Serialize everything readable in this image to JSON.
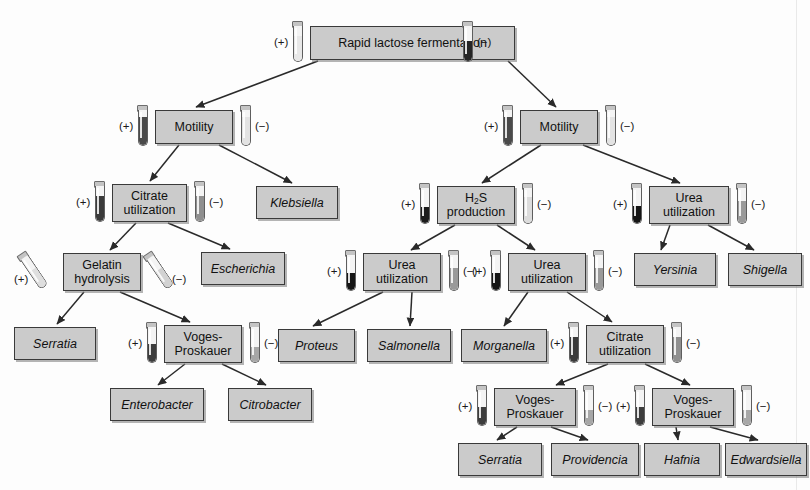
{
  "diagram": {
    "type": "decision-tree",
    "colors": {
      "box_fill": "#cbcbcb",
      "box_border": "#3a3a3a",
      "page_background": "#fdfdfd",
      "arrow": "#2a2a2a",
      "tube_positive_fill": "#2d2d2d",
      "tube_negative_fill": "#b4b4b4"
    },
    "sign_positive": "(+)",
    "sign_negative": "(−)",
    "nodes": [
      {
        "id": "n1",
        "kind": "test",
        "label": "Rapid lactose fermentation",
        "x": 310,
        "y": 26,
        "w": 205,
        "h": 34
      },
      {
        "id": "n2",
        "kind": "test",
        "label": "Motility",
        "x": 155,
        "y": 110,
        "w": 78,
        "h": 34
      },
      {
        "id": "n3",
        "kind": "test",
        "label": "Motility",
        "x": 520,
        "y": 110,
        "w": 78,
        "h": 34
      },
      {
        "id": "n4",
        "kind": "test",
        "label": "Citrate utilization",
        "x": 112,
        "y": 184,
        "w": 75,
        "h": 38
      },
      {
        "id": "n5",
        "kind": "genus",
        "label": "Klebsiella",
        "x": 256,
        "y": 186,
        "w": 82,
        "h": 33
      },
      {
        "id": "n6",
        "kind": "test",
        "label": "H2S production",
        "x": 437,
        "y": 186,
        "w": 78,
        "h": 38,
        "html": "H<sub>2</sub>S<br>production"
      },
      {
        "id": "n7",
        "kind": "test",
        "label": "Urea utilization",
        "x": 649,
        "y": 186,
        "w": 80,
        "h": 38
      },
      {
        "id": "n8",
        "kind": "test",
        "label": "Gelatin hydrolysis",
        "x": 63,
        "y": 253,
        "w": 78,
        "h": 38
      },
      {
        "id": "n9",
        "kind": "genus",
        "label": "Escherichia",
        "x": 201,
        "y": 252,
        "w": 84,
        "h": 33
      },
      {
        "id": "n10",
        "kind": "test",
        "label": "Urea utilization",
        "x": 363,
        "y": 253,
        "w": 78,
        "h": 38
      },
      {
        "id": "n11",
        "kind": "test",
        "label": "Urea utilization",
        "x": 508,
        "y": 253,
        "w": 78,
        "h": 38
      },
      {
        "id": "n12",
        "kind": "genus",
        "label": "Yersinia",
        "x": 634,
        "y": 253,
        "w": 82,
        "h": 33
      },
      {
        "id": "n13",
        "kind": "genus",
        "label": "Shigella",
        "x": 728,
        "y": 253,
        "w": 74,
        "h": 33
      },
      {
        "id": "n14",
        "kind": "genus",
        "label": "Serratia",
        "x": 14,
        "y": 327,
        "w": 82,
        "h": 33
      },
      {
        "id": "n15",
        "kind": "test",
        "label": "Voges-Proskauer",
        "x": 164,
        "y": 325,
        "w": 78,
        "h": 38,
        "html": "Voges-<br>Proskauer"
      },
      {
        "id": "n16",
        "kind": "genus",
        "label": "Proteus",
        "x": 278,
        "y": 329,
        "w": 77,
        "h": 33
      },
      {
        "id": "n17",
        "kind": "genus",
        "label": "Salmonella",
        "x": 367,
        "y": 329,
        "w": 84,
        "h": 33
      },
      {
        "id": "n18",
        "kind": "genus",
        "label": "Morganella",
        "x": 461,
        "y": 329,
        "w": 86,
        "h": 33
      },
      {
        "id": "n19",
        "kind": "test",
        "label": "Citrate utilization",
        "x": 586,
        "y": 325,
        "w": 78,
        "h": 38
      },
      {
        "id": "n20",
        "kind": "genus",
        "label": "Enterobacter",
        "x": 110,
        "y": 388,
        "w": 94,
        "h": 33
      },
      {
        "id": "n21",
        "kind": "genus",
        "label": "Citrobacter",
        "x": 228,
        "y": 388,
        "w": 84,
        "h": 33
      },
      {
        "id": "n22",
        "kind": "test",
        "label": "Voges-Proskauer",
        "x": 494,
        "y": 388,
        "w": 82,
        "h": 38,
        "html": "Voges-<br>Proskauer"
      },
      {
        "id": "n23",
        "kind": "test",
        "label": "Voges-Proskauer",
        "x": 652,
        "y": 388,
        "w": 82,
        "h": 38,
        "html": "Voges-<br>Proskauer"
      },
      {
        "id": "n24",
        "kind": "genus",
        "label": "Serratia",
        "x": 458,
        "y": 443,
        "w": 84,
        "h": 33
      },
      {
        "id": "n25",
        "kind": "genus",
        "label": "Providencia",
        "x": 551,
        "y": 443,
        "w": 88,
        "h": 33
      },
      {
        "id": "n26",
        "kind": "genus",
        "label": "Hafnia",
        "x": 644,
        "y": 443,
        "w": 76,
        "h": 33
      },
      {
        "id": "n27",
        "kind": "genus",
        "label": "Edwardsiella",
        "x": 725,
        "y": 443,
        "w": 82,
        "h": 33
      }
    ],
    "edges": [
      {
        "from": "n1",
        "to": "n2",
        "x1": 318,
        "y1": 61,
        "x2": 196,
        "y2": 107
      },
      {
        "from": "n1",
        "to": "n3",
        "x1": 508,
        "y1": 61,
        "x2": 556,
        "y2": 107
      },
      {
        "from": "n2",
        "to": "n4",
        "x1": 179,
        "y1": 145,
        "x2": 150,
        "y2": 181
      },
      {
        "from": "n2",
        "to": "n5",
        "x1": 219,
        "y1": 145,
        "x2": 292,
        "y2": 183
      },
      {
        "from": "n3",
        "to": "n6",
        "x1": 541,
        "y1": 145,
        "x2": 482,
        "y2": 183
      },
      {
        "from": "n3",
        "to": "n7",
        "x1": 583,
        "y1": 145,
        "x2": 680,
        "y2": 183
      },
      {
        "from": "n4",
        "to": "n8",
        "x1": 136,
        "y1": 223,
        "x2": 110,
        "y2": 250
      },
      {
        "from": "n4",
        "to": "n9",
        "x1": 168,
        "y1": 223,
        "x2": 230,
        "y2": 249
      },
      {
        "from": "n6",
        "to": "n10",
        "x1": 455,
        "y1": 225,
        "x2": 411,
        "y2": 250
      },
      {
        "from": "n6",
        "to": "n11",
        "x1": 497,
        "y1": 225,
        "x2": 535,
        "y2": 250
      },
      {
        "from": "n7",
        "to": "n12",
        "x1": 670,
        "y1": 225,
        "x2": 661,
        "y2": 250
      },
      {
        "from": "n7",
        "to": "n13",
        "x1": 708,
        "y1": 225,
        "x2": 754,
        "y2": 250
      },
      {
        "from": "n8",
        "to": "n14",
        "x1": 84,
        "y1": 292,
        "x2": 57,
        "y2": 324
      },
      {
        "from": "n8",
        "to": "n15",
        "x1": 120,
        "y1": 292,
        "x2": 190,
        "y2": 322
      },
      {
        "from": "n10",
        "to": "n16",
        "x1": 383,
        "y1": 292,
        "x2": 313,
        "y2": 326
      },
      {
        "from": "n10",
        "to": "n17",
        "x1": 412,
        "y1": 292,
        "x2": 410,
        "y2": 326
      },
      {
        "from": "n11",
        "to": "n18",
        "x1": 528,
        "y1": 292,
        "x2": 504,
        "y2": 326
      },
      {
        "from": "n11",
        "to": "n19",
        "x1": 567,
        "y1": 292,
        "x2": 612,
        "y2": 322
      },
      {
        "from": "n15",
        "to": "n20",
        "x1": 185,
        "y1": 364,
        "x2": 158,
        "y2": 385
      },
      {
        "from": "n15",
        "to": "n21",
        "x1": 222,
        "y1": 364,
        "x2": 266,
        "y2": 385
      },
      {
        "from": "n19",
        "to": "n22",
        "x1": 608,
        "y1": 364,
        "x2": 556,
        "y2": 385
      },
      {
        "from": "n19",
        "to": "n23",
        "x1": 645,
        "y1": 364,
        "x2": 690,
        "y2": 385
      },
      {
        "from": "n22",
        "to": "n24",
        "x1": 517,
        "y1": 427,
        "x2": 497,
        "y2": 440
      },
      {
        "from": "n22",
        "to": "n25",
        "x1": 551,
        "y1": 427,
        "x2": 588,
        "y2": 440
      },
      {
        "from": "n23",
        "to": "n26",
        "x1": 676,
        "y1": 427,
        "x2": 678,
        "y2": 440
      },
      {
        "from": "n23",
        "to": "n27",
        "x1": 710,
        "y1": 427,
        "x2": 758,
        "y2": 440
      }
    ],
    "tubes": [
      {
        "for": "n1",
        "result": "positive",
        "style": "broth-light",
        "x": 291,
        "y": 21,
        "sign_x": 274,
        "sign_y": 36
      },
      {
        "for": "n1",
        "result": "negative",
        "style": "broth-dark",
        "x": 461,
        "y": 21,
        "sign_x": 477,
        "sign_y": 36
      },
      {
        "for": "n2",
        "result": "positive",
        "style": "motility-pos",
        "x": 136,
        "y": 105,
        "sign_x": 119,
        "sign_y": 120
      },
      {
        "for": "n2",
        "result": "negative",
        "style": "motility-neg",
        "x": 239,
        "y": 105,
        "sign_x": 255,
        "sign_y": 120
      },
      {
        "for": "n3",
        "result": "positive",
        "style": "motility-pos",
        "x": 501,
        "y": 105,
        "sign_x": 484,
        "sign_y": 120
      },
      {
        "for": "n3",
        "result": "negative",
        "style": "motility-neg",
        "x": 604,
        "y": 105,
        "sign_x": 620,
        "sign_y": 120
      },
      {
        "for": "n4",
        "result": "positive",
        "style": "slant-dark",
        "x": 93,
        "y": 181,
        "sign_x": 76,
        "sign_y": 196
      },
      {
        "for": "n4",
        "result": "negative",
        "style": "slant-light",
        "x": 193,
        "y": 181,
        "sign_x": 209,
        "sign_y": 196
      },
      {
        "for": "n6",
        "result": "positive",
        "style": "h2s-pos",
        "x": 418,
        "y": 183,
        "sign_x": 401,
        "sign_y": 198
      },
      {
        "for": "n6",
        "result": "negative",
        "style": "h2s-neg",
        "x": 521,
        "y": 183,
        "sign_x": 537,
        "sign_y": 198
      },
      {
        "for": "n7",
        "result": "positive",
        "style": "urea-pos",
        "x": 630,
        "y": 183,
        "sign_x": 613,
        "sign_y": 198
      },
      {
        "for": "n7",
        "result": "negative",
        "style": "urea-neg",
        "x": 735,
        "y": 183,
        "sign_x": 751,
        "sign_y": 198
      },
      {
        "for": "n8",
        "result": "positive",
        "style": "gel-pos",
        "x": 26,
        "y": 250,
        "sign_x": 14,
        "sign_y": 273,
        "tilt": true
      },
      {
        "for": "n8",
        "result": "negative",
        "style": "gel-neg",
        "x": 152,
        "y": 250,
        "sign_x": 172,
        "sign_y": 273,
        "tilt": true
      },
      {
        "for": "n10",
        "result": "positive",
        "style": "urea-pos",
        "x": 344,
        "y": 250,
        "sign_x": 327,
        "sign_y": 265
      },
      {
        "for": "n10",
        "result": "negative",
        "style": "urea-neg",
        "x": 447,
        "y": 250,
        "sign_x": 463,
        "sign_y": 265
      },
      {
        "for": "n11",
        "result": "positive",
        "style": "urea-pos",
        "x": 489,
        "y": 250,
        "sign_x": 472,
        "sign_y": 265
      },
      {
        "for": "n11",
        "result": "negative",
        "style": "urea-neg",
        "x": 592,
        "y": 250,
        "sign_x": 608,
        "sign_y": 265
      },
      {
        "for": "n15",
        "result": "positive",
        "style": "vp-pos",
        "x": 145,
        "y": 322,
        "sign_x": 128,
        "sign_y": 337
      },
      {
        "for": "n15",
        "result": "negative",
        "style": "vp-neg",
        "x": 248,
        "y": 322,
        "sign_x": 264,
        "sign_y": 337
      },
      {
        "for": "n19",
        "result": "positive",
        "style": "slant-dark",
        "x": 567,
        "y": 322,
        "sign_x": 550,
        "sign_y": 337
      },
      {
        "for": "n19",
        "result": "negative",
        "style": "slant-light",
        "x": 670,
        "y": 322,
        "sign_x": 686,
        "sign_y": 337
      },
      {
        "for": "n22",
        "result": "positive",
        "style": "vp-pos",
        "x": 475,
        "y": 385,
        "sign_x": 458,
        "sign_y": 400
      },
      {
        "for": "n22",
        "result": "negative",
        "style": "vp-neg",
        "x": 582,
        "y": 385,
        "sign_x": 598,
        "sign_y": 400
      },
      {
        "for": "n23",
        "result": "positive",
        "style": "vp-pos",
        "x": 633,
        "y": 385,
        "sign_x": 616,
        "sign_y": 400
      },
      {
        "for": "n23",
        "result": "negative",
        "style": "vp-neg",
        "x": 740,
        "y": 385,
        "sign_x": 756,
        "sign_y": 400
      }
    ]
  }
}
